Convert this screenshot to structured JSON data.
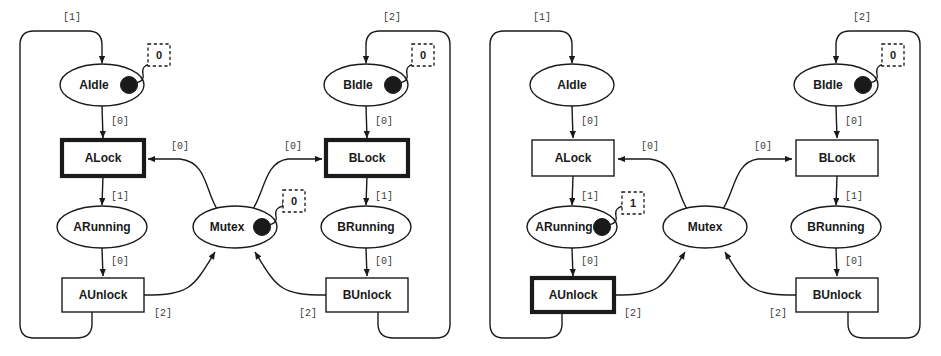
{
  "figure": {
    "type": "petri-net-pair"
  },
  "diagrams": [
    {
      "id": "left",
      "origin_x": 0,
      "places": [
        {
          "id": "AIdle",
          "label": "AIdle",
          "cx": 102,
          "cy": 85,
          "rx": 42,
          "ry": 21,
          "token": true,
          "token_value": "0",
          "token_box": {
            "x": 148,
            "y": 44
          }
        },
        {
          "id": "ARunning",
          "label": "ARunning",
          "cx": 102,
          "cy": 227,
          "rx": 45,
          "ry": 21,
          "token": false,
          "token_value": null,
          "token_box": null
        },
        {
          "id": "Mutex",
          "label": "Mutex",
          "cx": 235,
          "cy": 227,
          "rx": 42,
          "ry": 21,
          "token": true,
          "token_value": "0",
          "token_box": {
            "x": 283,
            "y": 190
          }
        },
        {
          "id": "BIdle",
          "label": "BIdle",
          "cx": 366,
          "cy": 85,
          "rx": 42,
          "ry": 21,
          "token": true,
          "token_value": "0",
          "token_box": {
            "x": 412,
            "y": 44
          }
        },
        {
          "id": "BRunning",
          "label": "BRunning",
          "cx": 366,
          "cy": 227,
          "rx": 45,
          "ry": 21,
          "token": false,
          "token_value": null,
          "token_box": null
        }
      ],
      "transitions": [
        {
          "id": "ALock",
          "label": "ALock",
          "x": 62,
          "y": 140,
          "w": 82,
          "h": 36,
          "bold": true
        },
        {
          "id": "AUnlock",
          "label": "AUnlock",
          "x": 62,
          "y": 278,
          "w": 82,
          "h": 34,
          "bold": false
        },
        {
          "id": "BLock",
          "label": "BLock",
          "x": 326,
          "y": 140,
          "w": 82,
          "h": 36,
          "bold": true
        },
        {
          "id": "BUnlock",
          "label": "BUnlock",
          "x": 326,
          "y": 278,
          "w": 82,
          "h": 34,
          "bold": false
        }
      ],
      "arc_labels": [
        {
          "text": "[1]",
          "x": 72,
          "y": 17
        },
        {
          "text": "[0]",
          "x": 120,
          "y": 121
        },
        {
          "text": "[1]",
          "x": 120,
          "y": 196
        },
        {
          "text": "[0]",
          "x": 120,
          "y": 261
        },
        {
          "text": "[2]",
          "x": 163,
          "y": 313
        },
        {
          "text": "[0]",
          "x": 180,
          "y": 146
        },
        {
          "text": "[0]",
          "x": 293,
          "y": 146
        },
        {
          "text": "[2]",
          "x": 308,
          "y": 313
        },
        {
          "text": "[2]",
          "x": 392,
          "y": 17
        },
        {
          "text": "[0]",
          "x": 384,
          "y": 121
        },
        {
          "text": "[1]",
          "x": 384,
          "y": 196
        },
        {
          "text": "[0]",
          "x": 384,
          "y": 261
        }
      ]
    },
    {
      "id": "right",
      "origin_x": 470,
      "places": [
        {
          "id": "AIdle",
          "label": "AIdle",
          "cx": 102,
          "cy": 85,
          "rx": 42,
          "ry": 21,
          "token": false,
          "token_value": null,
          "token_box": null
        },
        {
          "id": "ARunning",
          "label": "ARunning",
          "cx": 102,
          "cy": 227,
          "rx": 45,
          "ry": 21,
          "token": true,
          "token_value": "1",
          "token_box": {
            "x": 152,
            "y": 192
          }
        },
        {
          "id": "Mutex",
          "label": "Mutex",
          "cx": 235,
          "cy": 227,
          "rx": 42,
          "ry": 21,
          "token": false,
          "token_value": null,
          "token_box": null
        },
        {
          "id": "BIdle",
          "label": "BIdle",
          "cx": 366,
          "cy": 85,
          "rx": 42,
          "ry": 21,
          "token": true,
          "token_value": "0",
          "token_box": {
            "x": 412,
            "y": 44
          }
        },
        {
          "id": "BRunning",
          "label": "BRunning",
          "cx": 366,
          "cy": 227,
          "rx": 45,
          "ry": 21,
          "token": false,
          "token_value": null,
          "token_box": null
        }
      ],
      "transitions": [
        {
          "id": "ALock",
          "label": "ALock",
          "x": 62,
          "y": 140,
          "w": 82,
          "h": 36,
          "bold": false
        },
        {
          "id": "AUnlock",
          "label": "AUnlock",
          "x": 62,
          "y": 278,
          "w": 82,
          "h": 34,
          "bold": true
        },
        {
          "id": "BLock",
          "label": "BLock",
          "x": 326,
          "y": 140,
          "w": 82,
          "h": 36,
          "bold": false
        },
        {
          "id": "BUnlock",
          "label": "BUnlock",
          "x": 326,
          "y": 278,
          "w": 82,
          "h": 34,
          "bold": false
        }
      ],
      "arc_labels": [
        {
          "text": "[1]",
          "x": 72,
          "y": 17
        },
        {
          "text": "[0]",
          "x": 120,
          "y": 121
        },
        {
          "text": "[1]",
          "x": 120,
          "y": 196
        },
        {
          "text": "[0]",
          "x": 120,
          "y": 261
        },
        {
          "text": "[2]",
          "x": 163,
          "y": 313
        },
        {
          "text": "[0]",
          "x": 180,
          "y": 146
        },
        {
          "text": "[0]",
          "x": 293,
          "y": 146
        },
        {
          "text": "[2]",
          "x": 308,
          "y": 313
        },
        {
          "text": "[2]",
          "x": 392,
          "y": 17
        },
        {
          "text": "[0]",
          "x": 384,
          "y": 121
        },
        {
          "text": "[1]",
          "x": 384,
          "y": 196
        },
        {
          "text": "[0]",
          "x": 384,
          "y": 261
        }
      ]
    }
  ],
  "colors": {
    "ink": "#1a1a1a",
    "label_ink": "#3c3c3c",
    "paper": "#ffffff"
  }
}
